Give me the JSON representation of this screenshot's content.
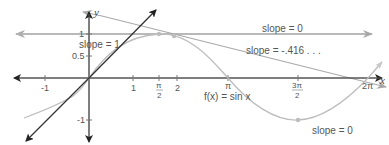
{
  "figure": {
    "function_label": "f(x) = sin x",
    "axes": {
      "x_label": "x",
      "y_label": "y",
      "x_ticks": [
        "-1",
        "1",
        "π/2",
        "2",
        "π",
        "3π/2",
        "2π"
      ],
      "y_ticks": [
        "1",
        "0.5",
        "-1"
      ]
    },
    "tick_labels": {
      "xm1": "-1",
      "x1": "1",
      "xpi2_num": "π",
      "xpi2_den": "2",
      "x2": "2",
      "xpi": "π",
      "x3pi2_num": "3π",
      "x3pi2_den": "2",
      "x2pi": "2π",
      "y1": "1",
      "y05": "0.5",
      "ym1": "-1"
    },
    "annotations": {
      "slope_one": "slope = 1",
      "slope_zero_top": "slope = 0",
      "slope_neg": "slope = -.416 . . .",
      "slope_zero_bottom": "slope = 0"
    },
    "tangent_lines": [
      {
        "at_x": "0",
        "slope": "1"
      },
      {
        "at_x": "π/2",
        "slope": "0"
      },
      {
        "at_x": "2",
        "slope": "-.416..."
      },
      {
        "at_x": "3π/2",
        "slope": "0"
      }
    ],
    "colors": {
      "axis": "#555555",
      "curve": "#b0b0b0",
      "tangent_dark": "#333333",
      "tangent_light": "#a8a8a8",
      "text": "#555555"
    }
  }
}
